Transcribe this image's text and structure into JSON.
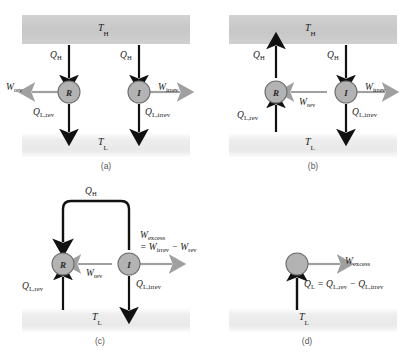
{
  "figure": {
    "colors": {
      "hot_reservoir": "#c9c9c9",
      "cold_reservoir": "#eeeeee",
      "device_circle": "#b3b3b3",
      "device_outline": "#6e6e6e",
      "heat_arrow": "#111111",
      "work_arrow": "#a0a0a0",
      "text": "#1a1a1a",
      "caption": "#555555"
    },
    "panels": [
      {
        "id": "a",
        "caption": "(a)",
        "hot_reservoir_label": "T",
        "hot_reservoir_sub": "H",
        "cold_reservoir_label": "T",
        "cold_reservoir_sub": "L",
        "devices": [
          {
            "name": "reversible-engine",
            "letter": "R"
          },
          {
            "name": "irreversible-engine",
            "letter": "I"
          }
        ],
        "labels": {
          "qh_left": "Q",
          "qh_left_sub": "H",
          "qh_right": "Q",
          "qh_right_sub": "H",
          "w_rev": "W",
          "w_rev_sub": "rev",
          "w_irrev": "W",
          "w_irrev_sub": "irrev",
          "ql_rev": "Q",
          "ql_rev_sub": "L,rev",
          "ql_irrev": "Q",
          "ql_irrev_sub": "L,irrev"
        }
      },
      {
        "id": "b",
        "caption": "(b)",
        "hot_reservoir_label": "T",
        "hot_reservoir_sub": "H",
        "cold_reservoir_label": "T",
        "cold_reservoir_sub": "L",
        "devices": [
          {
            "name": "reversed-reversible-engine",
            "letter": "R"
          },
          {
            "name": "irreversible-engine",
            "letter": "I"
          }
        ],
        "labels": {
          "qh_left": "Q",
          "qh_left_sub": "H",
          "qh_right": "Q",
          "qh_right_sub": "H",
          "w_rev": "W",
          "w_rev_sub": "rev",
          "w_irrev": "W",
          "w_irrev_sub": "irrev",
          "ql_rev": "Q",
          "ql_rev_sub": "L,rev",
          "ql_irrev": "Q",
          "ql_irrev_sub": "L,irrev"
        }
      },
      {
        "id": "c",
        "caption": "(c)",
        "cold_reservoir_label": "T",
        "cold_reservoir_sub": "L",
        "devices": [
          {
            "name": "reversed-reversible-engine",
            "letter": "R"
          },
          {
            "name": "irreversible-engine",
            "letter": "I"
          }
        ],
        "labels": {
          "qh_loop": "Q",
          "qh_loop_sub": "H",
          "w_rev": "W",
          "w_rev_sub": "rev",
          "w_excess": "W",
          "w_excess_sub": "excess",
          "w_excess_eq_a": "= W",
          "w_excess_eq_a_sub": "irrev",
          "w_excess_eq_b": "− W",
          "w_excess_eq_b_sub": "rev",
          "ql_rev": "Q",
          "ql_rev_sub": "L,rev",
          "ql_irrev": "Q",
          "ql_irrev_sub": "L,irrev"
        }
      },
      {
        "id": "d",
        "caption": "(d)",
        "cold_reservoir_label": "T",
        "cold_reservoir_sub": "L",
        "devices": [
          {
            "name": "combined-device",
            "letter": ""
          }
        ],
        "labels": {
          "w_excess": "W",
          "w_excess_sub": "excess",
          "ql_eq_1": "Q",
          "ql_eq_1_sub": "L",
          "ql_eq_2": "= Q",
          "ql_eq_2_sub": "L,rev",
          "ql_eq_3": "− Q",
          "ql_eq_3_sub": "L,irrev"
        }
      }
    ]
  }
}
